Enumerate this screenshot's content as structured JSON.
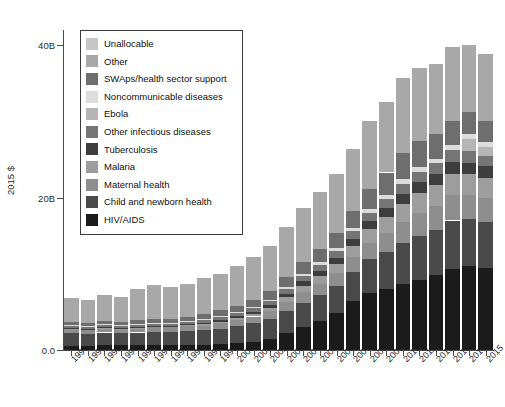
{
  "chart_data": {
    "type": "bar",
    "subtype": "stacked",
    "title": "",
    "xlabel": "",
    "ylabel": "2015 $",
    "ylim": [
      0,
      42
    ],
    "yticks": [
      0,
      20,
      40
    ],
    "ytick_labels": [
      "0.0",
      "20B",
      "40B"
    ],
    "grid": false,
    "legend_position": "upper-left-inside",
    "units": "billions of 2015 US dollars",
    "categories": [
      "1990",
      "1991",
      "1992",
      "1993",
      "1994",
      "1995",
      "1996",
      "1997",
      "1998",
      "1999",
      "2000",
      "2001",
      "2002",
      "2003",
      "2004",
      "2005",
      "2006",
      "2007",
      "2008",
      "2009",
      "2010",
      "2011",
      "2012",
      "2013",
      "2014",
      "2015"
    ],
    "series": [
      {
        "name": "HIV/AIDS",
        "color": "#1b1b1b",
        "values": [
          0.5,
          0.5,
          0.6,
          0.6,
          0.6,
          0.6,
          0.6,
          0.6,
          0.7,
          0.8,
          0.9,
          1.1,
          1.5,
          2.2,
          3.0,
          3.8,
          4.8,
          6.4,
          7.5,
          8.0,
          8.6,
          9.2,
          9.8,
          10.6,
          11.0,
          10.7
        ]
      },
      {
        "name": "Child and newborn health",
        "color": "#4a4a4a",
        "values": [
          1.7,
          1.6,
          1.7,
          1.6,
          1.7,
          1.8,
          1.8,
          1.9,
          1.9,
          2.0,
          2.2,
          2.4,
          2.6,
          2.9,
          3.2,
          3.4,
          3.6,
          3.9,
          4.4,
          4.9,
          5.4,
          5.8,
          6.0,
          6.4,
          6.2,
          6.1
        ]
      },
      {
        "name": "Maternal health",
        "color": "#8e8e8e",
        "values": [
          0.5,
          0.5,
          0.5,
          0.5,
          0.5,
          0.6,
          0.6,
          0.6,
          0.6,
          0.7,
          0.8,
          0.9,
          1.0,
          1.2,
          1.4,
          1.5,
          1.7,
          1.9,
          2.2,
          2.5,
          2.8,
          3.0,
          3.1,
          3.3,
          3.2,
          3.2
        ]
      },
      {
        "name": "Malaria",
        "color": "#9d9d9d",
        "values": [
          0.1,
          0.1,
          0.1,
          0.1,
          0.1,
          0.1,
          0.1,
          0.2,
          0.2,
          0.2,
          0.3,
          0.3,
          0.4,
          0.6,
          0.8,
          1.0,
          1.2,
          1.5,
          1.8,
          2.1,
          2.4,
          2.6,
          2.7,
          2.8,
          2.7,
          2.6
        ]
      },
      {
        "name": "Tuberculosis",
        "color": "#3d3d3d",
        "values": [
          0.1,
          0.1,
          0.1,
          0.1,
          0.1,
          0.1,
          0.1,
          0.1,
          0.2,
          0.2,
          0.2,
          0.3,
          0.4,
          0.5,
          0.6,
          0.7,
          0.8,
          0.9,
          1.0,
          1.1,
          1.3,
          1.4,
          1.5,
          1.6,
          1.5,
          1.5
        ]
      },
      {
        "name": "Other infectious diseases",
        "color": "#757575",
        "values": [
          0.3,
          0.3,
          0.3,
          0.3,
          0.3,
          0.3,
          0.3,
          0.3,
          0.4,
          0.4,
          0.4,
          0.5,
          0.5,
          0.6,
          0.7,
          0.8,
          0.9,
          1.0,
          1.1,
          1.2,
          1.3,
          1.4,
          1.4,
          1.5,
          1.5,
          1.4
        ]
      },
      {
        "name": "Ebola",
        "color": "#b5b5b5",
        "values": [
          0,
          0,
          0,
          0,
          0,
          0,
          0,
          0,
          0,
          0,
          0,
          0,
          0,
          0,
          0,
          0,
          0,
          0,
          0,
          0,
          0,
          0,
          0,
          0,
          1.6,
          1.1
        ]
      },
      {
        "name": "Noncommunicable diseases",
        "color": "#dcdcdc",
        "values": [
          0.1,
          0.1,
          0.1,
          0.1,
          0.1,
          0.1,
          0.1,
          0.1,
          0.1,
          0.2,
          0.2,
          0.2,
          0.2,
          0.3,
          0.3,
          0.3,
          0.4,
          0.4,
          0.5,
          0.5,
          0.6,
          0.6,
          0.6,
          0.7,
          0.7,
          0.7
        ]
      },
      {
        "name": "SWAps/health sector support",
        "color": "#6e6e6e",
        "values": [
          0.4,
          0.4,
          0.4,
          0.4,
          0.5,
          0.5,
          0.5,
          0.5,
          0.6,
          0.7,
          0.8,
          0.9,
          1.1,
          1.3,
          1.6,
          1.8,
          2.0,
          2.2,
          2.6,
          3.0,
          3.4,
          3.4,
          3.2,
          3.1,
          2.9,
          2.8
        ]
      },
      {
        "name": "Other",
        "color": "#a8a8a8",
        "values": [
          3.1,
          2.9,
          3.4,
          3.3,
          4.1,
          4.4,
          4.2,
          4.4,
          4.8,
          4.8,
          5.2,
          5.6,
          6.0,
          6.6,
          7.0,
          7.4,
          7.7,
          8.2,
          8.9,
          9.3,
          9.9,
          9.6,
          9.3,
          9.8,
          8.7,
          8.8
        ]
      },
      {
        "name": "Unallocable",
        "color": "#c6c6c6",
        "values": [
          0,
          0,
          0,
          0,
          0,
          0,
          0,
          0,
          0,
          0,
          0,
          0,
          0,
          0,
          0,
          0,
          0,
          0,
          0,
          0,
          0,
          0,
          0,
          0,
          0,
          0
        ]
      }
    ]
  },
  "legend": {
    "items": [
      {
        "label": "Unallocable",
        "color": "#c6c6c6"
      },
      {
        "label": "Other",
        "color": "#a8a8a8"
      },
      {
        "label": "SWAps/health sector support",
        "color": "#6e6e6e"
      },
      {
        "label": "Noncommunicable diseases",
        "color": "#dcdcdc"
      },
      {
        "label": "Ebola",
        "color": "#b5b5b5"
      },
      {
        "label": "Other infectious diseases",
        "color": "#757575"
      },
      {
        "label": "Tuberculosis",
        "color": "#3d3d3d"
      },
      {
        "label": "Malaria",
        "color": "#9d9d9d"
      },
      {
        "label": "Maternal health",
        "color": "#8e8e8e"
      },
      {
        "label": "Child and newborn health",
        "color": "#4a4a4a"
      },
      {
        "label": "HIV/AIDS",
        "color": "#1b1b1b"
      }
    ]
  },
  "colors": {
    "axis": "#4d4d4d",
    "text": "#2b2b2b",
    "background": "#ffffff",
    "bar_gap_line": "#ffffff"
  }
}
